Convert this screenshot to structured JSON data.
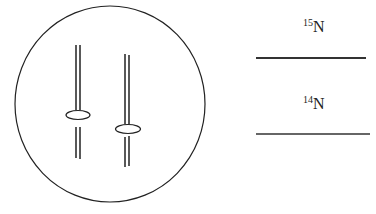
{
  "diagram": {
    "cell": {
      "shape": "circle",
      "chromosomes": [
        {
          "id": "chromosome-1",
          "strands": 2,
          "has_centromere": true
        },
        {
          "id": "chromosome-2",
          "strands": 2,
          "has_centromere": true
        }
      ]
    },
    "bands": [
      {
        "id": "band-15n",
        "isotope_mass": "15",
        "element": "N",
        "label": "15N",
        "line_style": "thick"
      },
      {
        "id": "band-14n",
        "isotope_mass": "14",
        "element": "N",
        "label": "14N",
        "line_style": "thin"
      }
    ],
    "colors": {
      "stroke": "#222222",
      "background": "#ffffff"
    }
  }
}
